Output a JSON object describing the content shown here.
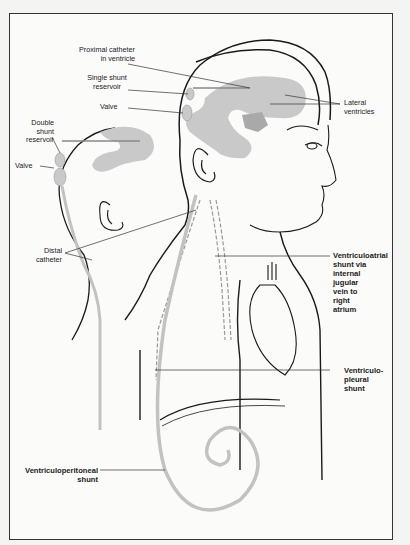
{
  "figure": {
    "colors": {
      "line": "#1a1a1a",
      "ventricle": "#c9c9c9",
      "tube": "#bdbdbd",
      "background": "#fbfbfa"
    }
  },
  "labels": {
    "proximal_catheter": "Proximal catheter\nin ventricle",
    "single_shunt_reservoir": "Single shunt\nreservoir",
    "valve_top": "Valve",
    "lateral_ventricles": "Lateral\nventricles",
    "double_shunt_reservoir": "Double\nshunt\nreservoir",
    "valve_left": "Valve",
    "distal_catheter": "Distal\ncatheter",
    "ventriculoatrial_shunt": "Ventriculoatrial\nshunt via\ninternal\njugular\nvein to\nright\natrium",
    "ventriculopleural_shunt": "Ventriculo-\npleural\nshunt",
    "ventriculoperitoneal_shunt": "Ventriculoperitoneal\nshunt"
  }
}
